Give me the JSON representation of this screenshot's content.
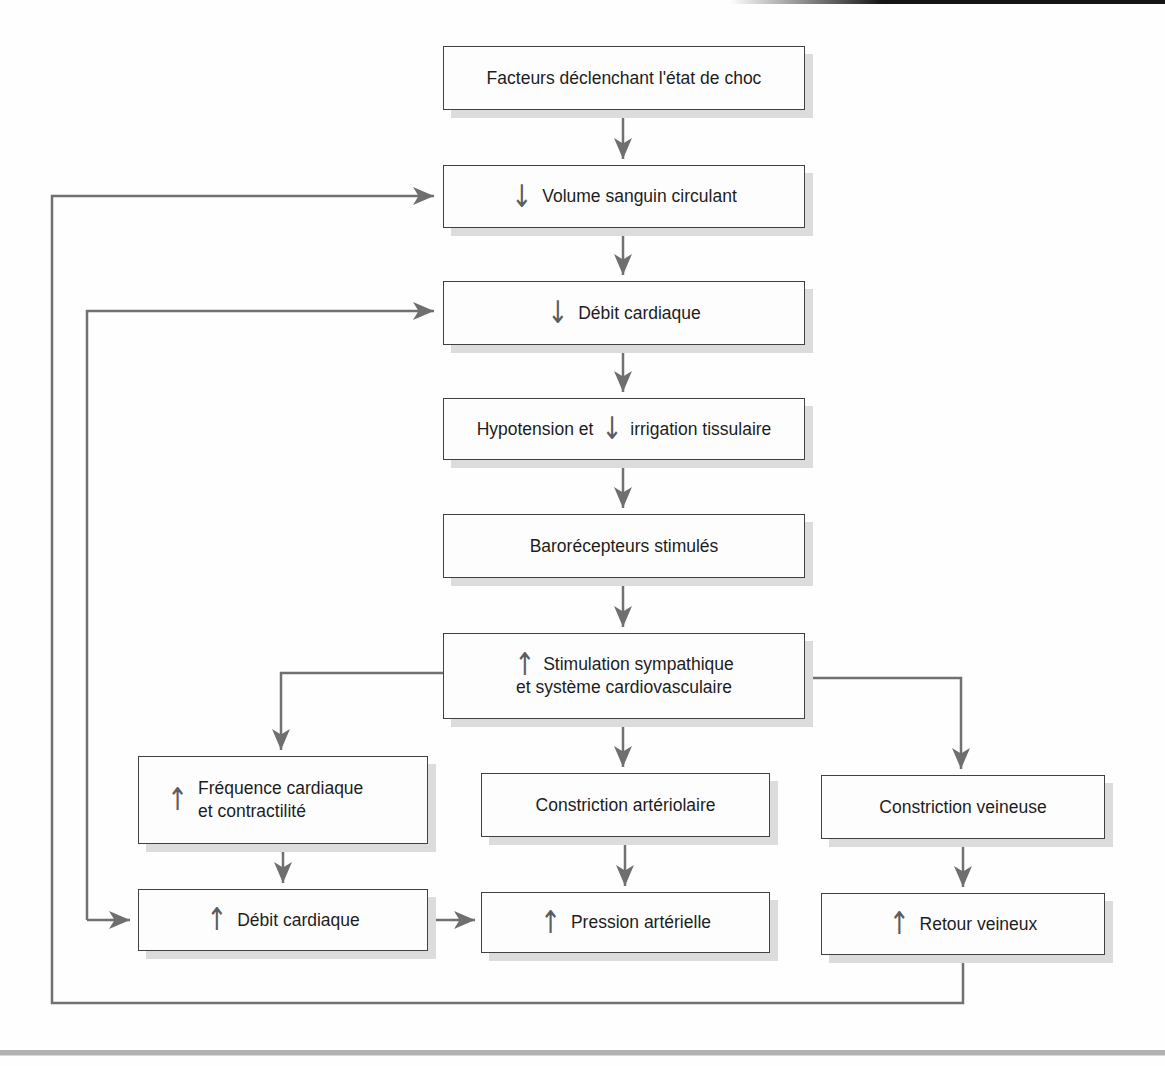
{
  "diagram": {
    "type": "flowchart",
    "language": "fr",
    "boxes": {
      "facteurs": {
        "text": "Facteurs déclenchant l'état de choc"
      },
      "volume": {
        "glyph": "↓",
        "text": "Volume sanguin circulant"
      },
      "debit_bas": {
        "glyph": "↓",
        "text": "Débit cardiaque"
      },
      "hypotension": {
        "pre": "Hypotension et",
        "glyph": "↓",
        "post": "irrigation tissulaire"
      },
      "barorecepteurs": {
        "text": "Barorécepteurs stimulés"
      },
      "stimulation": {
        "glyph": "↑",
        "line1": "Stimulation sympathique",
        "line2": "et système cardiovasculaire"
      },
      "frequence": {
        "glyph": "↑",
        "line1": "Fréquence cardiaque",
        "line2": "et contractilité"
      },
      "debit_haut": {
        "glyph": "↑",
        "text": "Débit cardiaque"
      },
      "constriction_arteriolaire": {
        "text": "Constriction artériolaire"
      },
      "pression": {
        "glyph": "↑",
        "text": "Pression artérielle"
      },
      "constriction_veineuse": {
        "text": "Constriction veineuse"
      },
      "retour": {
        "glyph": "↑",
        "text": "Retour veineux"
      }
    },
    "edges": [
      {
        "from": "facteurs",
        "to": "volume"
      },
      {
        "from": "volume",
        "to": "debit_bas"
      },
      {
        "from": "debit_bas",
        "to": "hypotension"
      },
      {
        "from": "hypotension",
        "to": "barorecepteurs"
      },
      {
        "from": "barorecepteurs",
        "to": "stimulation"
      },
      {
        "from": "stimulation",
        "to": "frequence"
      },
      {
        "from": "stimulation",
        "to": "constriction_arteriolaire"
      },
      {
        "from": "stimulation",
        "to": "constriction_veineuse"
      },
      {
        "from": "frequence",
        "to": "debit_haut"
      },
      {
        "from": "constriction_arteriolaire",
        "to": "pression"
      },
      {
        "from": "constriction_veineuse",
        "to": "retour"
      },
      {
        "from": "debit_haut",
        "to": "pression"
      },
      {
        "from": "retour",
        "to": "volume",
        "type": "feedback-outer-loop"
      },
      {
        "from": "feedback-inner-line",
        "to": "debit_bas",
        "type": "feedback"
      },
      {
        "from": "feedback-inner-line",
        "to": "debit_haut",
        "type": "feedback"
      }
    ],
    "colors": {
      "connector": "#717171",
      "box_border": "#414141",
      "box_fill": "#fdfdfd",
      "box_shadow": "#dcdcdc",
      "text": "#1d1d1d",
      "glyph_arrow": "#5d5d5d",
      "bottom_rule": "#b2b2b2",
      "top_edge_bar": "#151515"
    }
  }
}
